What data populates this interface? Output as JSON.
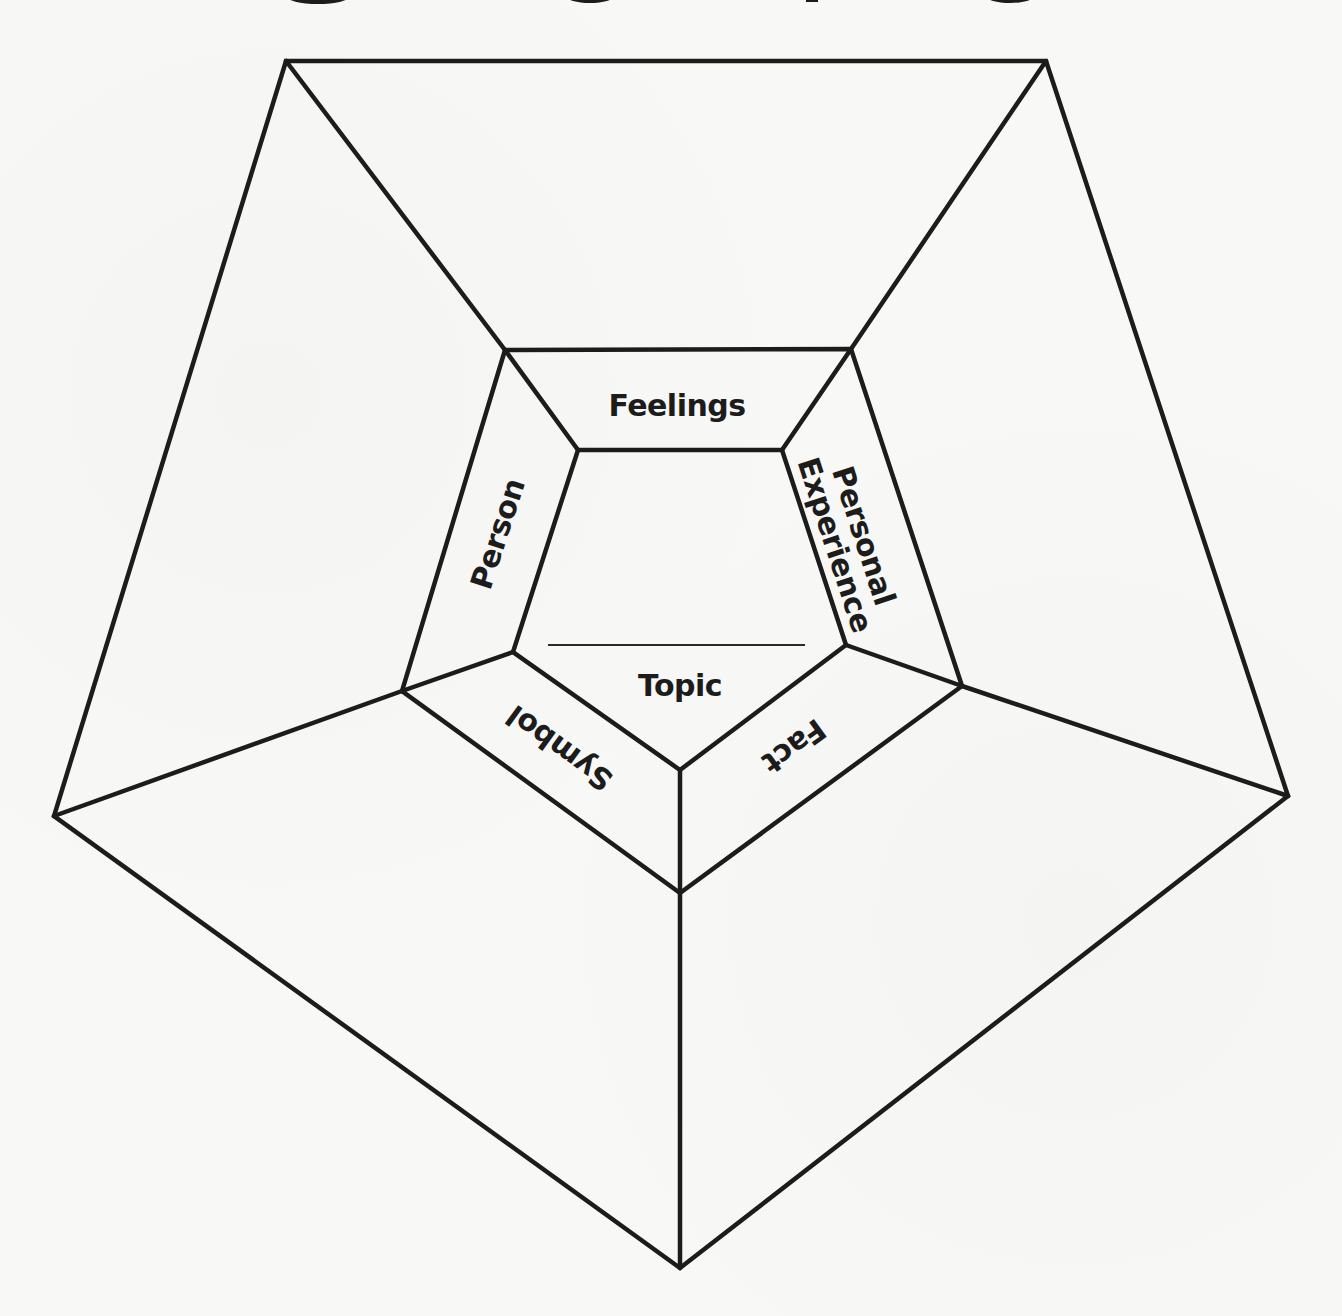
{
  "diagram": {
    "type": "concentric-pentagon-organizer",
    "colors": {
      "line": "#1c1c1c",
      "background": "#f8f8f6"
    },
    "center": {
      "label": "Topic",
      "has_write_line": true
    },
    "ring_labels": {
      "top": "Feelings",
      "upper_right": "Personal Experience",
      "upper_right_line1": "Personal",
      "upper_right_line2": "Experience",
      "lower_right": "Fact",
      "lower_left": "Symbol",
      "upper_left": "Person"
    },
    "outer_regions": [
      "top",
      "upper-right",
      "lower-right",
      "lower-left",
      "upper-left"
    ]
  }
}
